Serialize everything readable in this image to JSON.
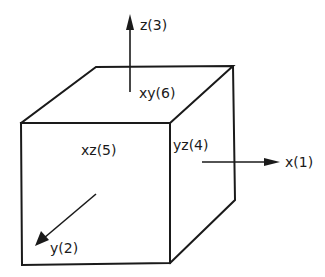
{
  "diagram": {
    "type": "cube-with-axes",
    "axes": [
      {
        "id": "x",
        "label": "x(1)"
      },
      {
        "id": "y",
        "label": "y(2)"
      },
      {
        "id": "z",
        "label": "z(3)"
      }
    ],
    "faces": [
      {
        "id": "yz",
        "label": "yz(4)"
      },
      {
        "id": "xz",
        "label": "xz(5)"
      },
      {
        "id": "xy",
        "label": "xy(6)"
      }
    ],
    "colors": {
      "ink": "#1a1a1a",
      "background": "#ffffff"
    }
  }
}
